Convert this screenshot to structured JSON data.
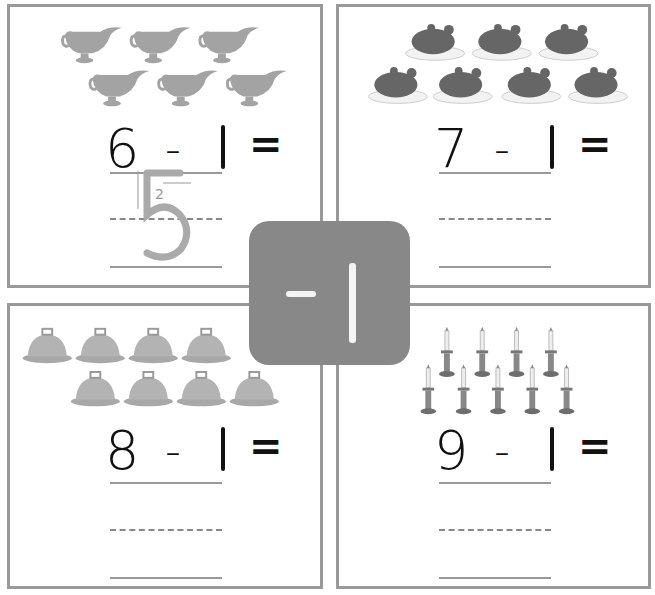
{
  "badge": {
    "operator": "-",
    "operand": "1",
    "bg_color": "#888888"
  },
  "panels": [
    {
      "id": "top-left",
      "picture": "gravy-boat",
      "picture_count": 6,
      "rows": [
        3,
        3
      ],
      "a": "6",
      "op": "-",
      "b": "1",
      "eq": "=",
      "answer_trace": "5",
      "stroke_hint": "2"
    },
    {
      "id": "top-right",
      "picture": "roast-turkey",
      "picture_count": 7,
      "rows": [
        3,
        4
      ],
      "a": "7",
      "op": "-",
      "b": "1",
      "eq": "=",
      "answer_trace": ""
    },
    {
      "id": "bottom-left",
      "picture": "serving-cloche",
      "picture_count": 8,
      "rows": [
        4,
        4
      ],
      "a": "8",
      "op": "-",
      "b": "1",
      "eq": "=",
      "answer_trace": ""
    },
    {
      "id": "bottom-right",
      "picture": "candlestick",
      "picture_count": 9,
      "rows": [
        4,
        5
      ],
      "a": "9",
      "op": "-",
      "b": "1",
      "eq": "=",
      "answer_trace": ""
    }
  ],
  "colors": {
    "border": "#999999",
    "text": "#111111",
    "picture_gray": "#a0a0a0",
    "dark_gray": "#6e6e6e"
  }
}
